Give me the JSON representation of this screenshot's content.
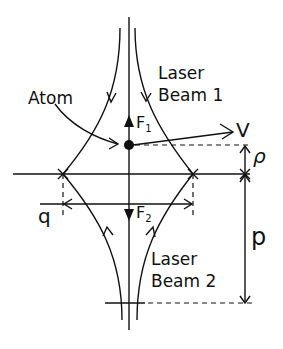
{
  "diagram": {
    "type": "two counter-propagating focused laser beams acting on an atom",
    "labels": {
      "atom": "Atom",
      "beam1_line1": "Laser",
      "beam1_line2": "Beam 1",
      "beam2_line1": "Laser",
      "beam2_line2": "Beam 2",
      "force1": "F",
      "force1_sub": "1",
      "force2": "F",
      "force2_sub": "2",
      "velocity": "V",
      "rho": "ρ",
      "q": "q",
      "p": "p"
    },
    "colors": {
      "ink": "#111111",
      "background": "#ffffff"
    }
  }
}
